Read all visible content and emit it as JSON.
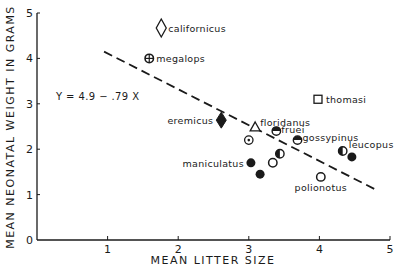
{
  "chart_data": {
    "type": "scatter",
    "title": "",
    "xlabel": "MEAN LITTER SIZE",
    "ylabel": "MEAN NEONATAL WEIGHT IN GRAMS",
    "xlim": [
      0,
      5
    ],
    "ylim": [
      0,
      5
    ],
    "xticks": [
      "0",
      "1",
      "2",
      "3",
      "4",
      "5"
    ],
    "yticks": [
      "0",
      "1",
      "2",
      "3",
      "4",
      "5"
    ],
    "grid": false,
    "regression": {
      "equation_label": "Y = 4.9 − .79 X",
      "intercept": 4.9,
      "slope": -0.79,
      "x_range": [
        0.95,
        4.78
      ],
      "style": "dashed"
    },
    "points": [
      {
        "label": "californicus",
        "x": 1.76,
        "y": 4.67,
        "marker": "diamond-open"
      },
      {
        "label": "megalops",
        "x": 1.59,
        "y": 4.0,
        "marker": "circle-cross"
      },
      {
        "label": "eremicus",
        "x": 2.61,
        "y": 2.64,
        "marker": "diamond-filled"
      },
      {
        "label": "floridanus",
        "x": 3.09,
        "y": 2.49,
        "marker": "triangle-open"
      },
      {
        "label": "thomasi",
        "x": 3.98,
        "y": 3.1,
        "marker": "square-open"
      },
      {
        "label": "fruei",
        "x": 3.39,
        "y": 2.4,
        "marker": "circle-top-half"
      },
      {
        "label": "gossypinus",
        "x": 3.69,
        "y": 2.2,
        "marker": "circle-top-half"
      },
      {
        "label": "",
        "x": 3.0,
        "y": 2.2,
        "marker": "circle-dot"
      },
      {
        "label": "",
        "x": 3.44,
        "y": 1.9,
        "marker": "circle-left-half"
      },
      {
        "label": "maniculatus",
        "x": 3.03,
        "y": 1.7,
        "marker": "circle-filled"
      },
      {
        "label": "",
        "x": 3.34,
        "y": 1.7,
        "marker": "circle-open"
      },
      {
        "label": "",
        "x": 3.16,
        "y": 1.45,
        "marker": "circle-filled"
      },
      {
        "label": "leucopus",
        "x": 4.33,
        "y": 1.96,
        "marker": "circle-left-half"
      },
      {
        "label": "",
        "x": 4.46,
        "y": 1.83,
        "marker": "circle-filled"
      },
      {
        "label": "polionotus",
        "x": 4.02,
        "y": 1.39,
        "marker": "circle-open"
      }
    ]
  }
}
